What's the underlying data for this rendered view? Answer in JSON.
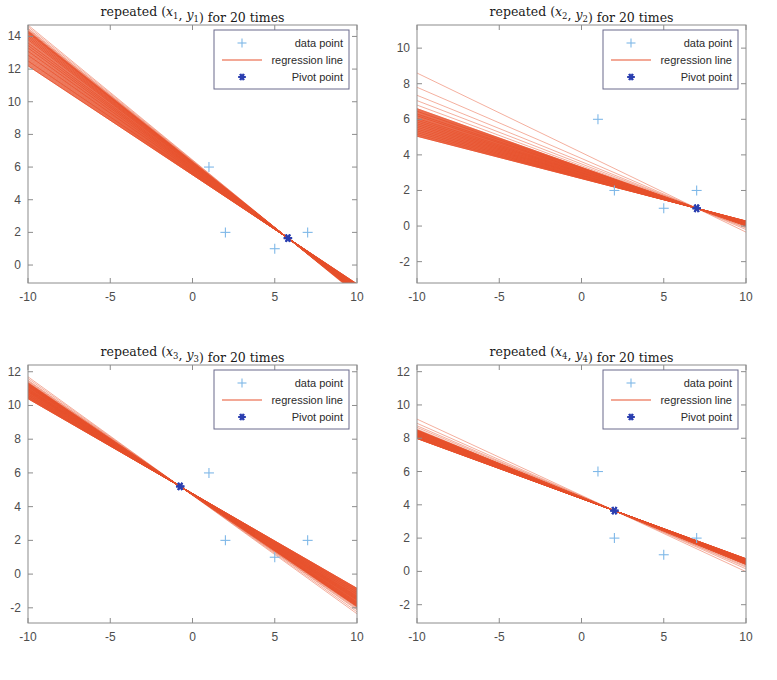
{
  "figure": {
    "width": 777,
    "height": 680,
    "background": "#ffffff",
    "layout": "2x2 grid of subplots"
  },
  "colors": {
    "regression_line": "#e8522e",
    "data_point": "#7fb8e8",
    "pivot_point": "#2b3fb0",
    "axis": "#8c8c8c",
    "tick_text": "#4d4d4d",
    "title_text": "#1a1a1a",
    "legend_border": "#6b6b8c",
    "legend_background": "#ffffff"
  },
  "legend": {
    "entries": [
      {
        "label": "data point",
        "marker": "plus",
        "color": "#7fb8e8"
      },
      {
        "label": "regression line",
        "marker": "line",
        "color": "#e8522e"
      },
      {
        "label": "Pivot point",
        "marker": "star",
        "color": "#2b3fb0"
      }
    ]
  },
  "chart_data": [
    {
      "type": "line",
      "id": "panel-1",
      "title": "repeated (x1, y1) for 20 times",
      "title_parts": {
        "prefix": "repeated (",
        "var1": "x",
        "sub1": "1",
        "sep": ", ",
        "var2": "y",
        "sub2": "1",
        "suffix": ") for 20 times"
      },
      "xlabel": "",
      "ylabel": "",
      "xlim": [
        -10,
        10
      ],
      "ylim": [
        -1.1,
        14.7
      ],
      "xticks": [
        -10,
        -5,
        0,
        5,
        10
      ],
      "xticklabels": [
        "-10",
        "-5",
        "0",
        "5",
        "10"
      ],
      "yticks": [
        0,
        2,
        4,
        6,
        8,
        10,
        12,
        14
      ],
      "yticklabels": [
        "0",
        "2",
        "4",
        "6",
        "8",
        "10",
        "12",
        "14"
      ],
      "grid": false,
      "legend_position": "upper right",
      "pivot_point": {
        "x": 5.8,
        "y": 1.65
      },
      "data_points": [
        {
          "x": 2,
          "y": 2
        },
        {
          "x": 5,
          "y": 1
        },
        {
          "x": 7,
          "y": 2
        },
        {
          "x": 1,
          "y": 6
        }
      ],
      "n_lines": 20,
      "line_intercepts_at_xmin": [
        14.7,
        14.6,
        14.5,
        14.45,
        14.4,
        14.35,
        14.3,
        14.25,
        14.2,
        14.1,
        14.0,
        13.9,
        13.8,
        13.6,
        13.45,
        13.3,
        13.1,
        12.85,
        12.5,
        12.2
      ]
    },
    {
      "type": "line",
      "id": "panel-2",
      "title": "repeated (x2, y2) for 20 times",
      "title_parts": {
        "prefix": "repeated (",
        "var1": "x",
        "sub1": "2",
        "sep": ", ",
        "var2": "y",
        "sub2": "2",
        "suffix": ") for 20 times"
      },
      "xlabel": "",
      "ylabel": "",
      "xlim": [
        -10,
        10
      ],
      "ylim": [
        -3.2,
        11.3
      ],
      "xticks": [
        -10,
        -5,
        0,
        5,
        10
      ],
      "xticklabels": [
        "-10",
        "-5",
        "0",
        "5",
        "10"
      ],
      "yticks": [
        -2,
        0,
        2,
        4,
        6,
        8,
        10
      ],
      "yticklabels": [
        "-2",
        "0",
        "2",
        "4",
        "6",
        "8",
        "10"
      ],
      "grid": false,
      "legend_position": "upper right",
      "pivot_point": {
        "x": 7.0,
        "y": 1.0
      },
      "data_points": [
        {
          "x": 1,
          "y": 6
        },
        {
          "x": 2,
          "y": 2
        },
        {
          "x": 5,
          "y": 1
        },
        {
          "x": 7,
          "y": 2
        }
      ],
      "n_lines": 20,
      "line_intercepts_at_xmin": [
        8.6,
        7.8,
        7.35,
        7.05,
        6.8,
        6.6,
        6.45,
        6.3,
        6.2,
        6.05,
        5.95,
        5.85,
        5.75,
        5.65,
        5.55,
        5.45,
        5.35,
        5.25,
        5.15,
        5.05
      ]
    },
    {
      "type": "line",
      "id": "panel-3",
      "title": "repeated (x3, y3) for 20 times",
      "title_parts": {
        "prefix": "repeated (",
        "var1": "x",
        "sub1": "3",
        "sep": ", ",
        "var2": "y",
        "sub2": "3",
        "suffix": ") for 20 times"
      },
      "xlabel": "",
      "ylabel": "",
      "xlim": [
        -10,
        10
      ],
      "ylim": [
        -2.9,
        12.4
      ],
      "xticks": [
        -10,
        -5,
        0,
        5,
        10
      ],
      "xticklabels": [
        "-10",
        "-5",
        "0",
        "5",
        "10"
      ],
      "yticks": [
        -2,
        0,
        2,
        4,
        6,
        8,
        10,
        12
      ],
      "yticklabels": [
        "-2",
        "0",
        "2",
        "4",
        "6",
        "8",
        "10",
        "12"
      ],
      "grid": false,
      "legend_position": "upper right",
      "pivot_point": {
        "x": -0.75,
        "y": 5.2
      },
      "data_points": [
        {
          "x": 1,
          "y": 6
        },
        {
          "x": 2,
          "y": 2
        },
        {
          "x": 5,
          "y": 1
        },
        {
          "x": 7,
          "y": 2
        }
      ],
      "n_lines": 20,
      "line_intercepts_at_xmin": [
        11.7,
        11.6,
        11.5,
        11.45,
        11.4,
        11.35,
        11.3,
        11.25,
        11.2,
        11.15,
        11.1,
        11.0,
        10.95,
        10.9,
        10.85,
        10.8,
        10.7,
        10.6,
        10.5,
        10.4
      ]
    },
    {
      "type": "line",
      "id": "panel-4",
      "title": "repeated (x4, y4) for 20 times",
      "title_parts": {
        "prefix": "repeated (",
        "var1": "x",
        "sub1": "4",
        "sep": ", ",
        "var2": "y",
        "sub2": "4",
        "suffix": ") for 20 times"
      },
      "xlabel": "",
      "ylabel": "",
      "xlim": [
        -10,
        10
      ],
      "ylim": [
        -3.1,
        12.4
      ],
      "xticks": [
        -10,
        -5,
        0,
        5,
        10
      ],
      "xticklabels": [
        "-10",
        "-5",
        "0",
        "5",
        "10"
      ],
      "yticks": [
        -2,
        0,
        2,
        4,
        6,
        8,
        10,
        12
      ],
      "yticklabels": [
        "-2",
        "0",
        "2",
        "4",
        "6",
        "8",
        "10",
        "12"
      ],
      "grid": false,
      "legend_position": "upper right",
      "pivot_point": {
        "x": 2.0,
        "y": 3.65
      },
      "data_points": [
        {
          "x": 1,
          "y": 6
        },
        {
          "x": 2,
          "y": 2
        },
        {
          "x": 5,
          "y": 1
        },
        {
          "x": 7,
          "y": 2
        }
      ],
      "n_lines": 20,
      "line_intercepts_at_xmin": [
        9.15,
        8.9,
        8.75,
        8.65,
        8.55,
        8.5,
        8.45,
        8.4,
        8.35,
        8.3,
        8.25,
        8.2,
        8.15,
        8.12,
        8.1,
        8.07,
        8.05,
        8.03,
        8.0,
        7.98
      ]
    }
  ]
}
